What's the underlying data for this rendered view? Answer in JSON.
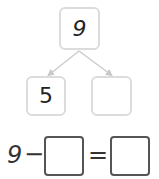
{
  "number_bond": {
    "whole": "9",
    "parts": [
      "5",
      ""
    ]
  },
  "equation": {
    "minuend": "9",
    "operator": "−",
    "blank1": "",
    "equals": "=",
    "blank2": ""
  },
  "colors": {
    "bond_border": "#dcdcdc",
    "connector": "#c8c8c8",
    "equation_border": "#555555"
  }
}
